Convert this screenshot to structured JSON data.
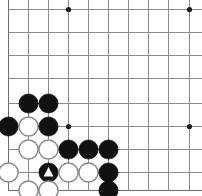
{
  "diagram": {
    "kind": "go-board-diagram",
    "board_pixel_width": 202,
    "board_pixel_height": 196,
    "background_color": "#ffffff",
    "line_color": "#8c8c8c",
    "edge_line_color": "#6d6d6d",
    "black_stone_color": "#111111",
    "white_stone_color": "#ffffff",
    "white_stone_outline": "#8a8a8a",
    "stone_radius": 9.6,
    "star_point_radius": 2.6,
    "visible_region_note": "lower-left corner of board; top and right edges are cut off",
    "geometry": {
      "column_x": [
        8,
        28,
        48,
        68,
        88,
        108,
        128,
        148,
        168,
        189
      ],
      "row_y": [
        9,
        32,
        55,
        78,
        103,
        126,
        149,
        172,
        190
      ],
      "column_labels": [
        "A",
        "B",
        "C",
        "D",
        "E",
        "F",
        "G",
        "H",
        "J",
        "K"
      ],
      "row_labels": [
        "r1",
        "r2",
        "r3",
        "r4",
        "r5",
        "r6",
        "r7",
        "r8",
        "r9"
      ],
      "left_edge_column_index": 0,
      "bottom_edge_row_index": 8
    },
    "star_points": [
      {
        "col": 3,
        "row": 0
      },
      {
        "col": 9,
        "row": 0
      },
      {
        "col": 3,
        "row": 5
      },
      {
        "col": 9,
        "row": 5
      }
    ],
    "stones": [
      {
        "color": "black",
        "col": 1,
        "row": 4,
        "marker": "none"
      },
      {
        "color": "black",
        "col": 2,
        "row": 4,
        "marker": "none"
      },
      {
        "color": "black",
        "col": 0,
        "row": 5,
        "marker": "none"
      },
      {
        "color": "white",
        "col": 1,
        "row": 5,
        "marker": "none"
      },
      {
        "color": "black",
        "col": 2,
        "row": 5,
        "marker": "none"
      },
      {
        "color": "white",
        "col": 1,
        "row": 6,
        "marker": "none"
      },
      {
        "color": "white",
        "col": 2,
        "row": 6,
        "marker": "none"
      },
      {
        "color": "black",
        "col": 3,
        "row": 6,
        "marker": "none"
      },
      {
        "color": "black",
        "col": 4,
        "row": 6,
        "marker": "none"
      },
      {
        "color": "black",
        "col": 5,
        "row": 6,
        "marker": "none"
      },
      {
        "color": "white",
        "col": 0,
        "row": 7,
        "marker": "none"
      },
      {
        "color": "black",
        "col": 2,
        "row": 7,
        "marker": "triangle"
      },
      {
        "color": "white",
        "col": 3,
        "row": 7,
        "marker": "none"
      },
      {
        "color": "white",
        "col": 4,
        "row": 7,
        "marker": "none"
      },
      {
        "color": "black",
        "col": 5,
        "row": 7,
        "marker": "none"
      },
      {
        "color": "white",
        "col": 1,
        "row": 8,
        "marker": "none"
      },
      {
        "color": "white",
        "col": 2,
        "row": 8,
        "marker": "none"
      },
      {
        "color": "black",
        "col": 5,
        "row": 8,
        "marker": "none"
      }
    ],
    "counts": {
      "black_stones": 10,
      "white_stones": 8,
      "marked_stones": 1
    }
  }
}
